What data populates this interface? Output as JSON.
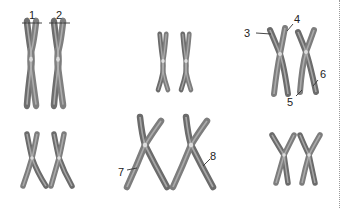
{
  "diagram": {
    "title": "",
    "chromosome_color": "#7a7a7a",
    "panels": [
      {
        "id": "top-left",
        "row": 1,
        "col": 1,
        "count": 2,
        "size": "tall"
      },
      {
        "id": "top-middle",
        "row": 1,
        "col": 2,
        "count": 2,
        "size": "small"
      },
      {
        "id": "top-right",
        "row": 1,
        "col": 3,
        "count": 2,
        "size": "medium"
      },
      {
        "id": "bottom-left",
        "row": 2,
        "col": 1,
        "count": 2,
        "size": "small"
      },
      {
        "id": "bottom-middle",
        "row": 2,
        "col": 2,
        "count": 2,
        "size": "large"
      },
      {
        "id": "bottom-right",
        "row": 2,
        "col": 3,
        "count": 2,
        "size": "small"
      }
    ],
    "labels": {
      "l1": "1",
      "l2": "2",
      "l3": "3",
      "l4": "4",
      "l5": "5",
      "l6": "6",
      "l7": "7",
      "l8": "8"
    }
  }
}
